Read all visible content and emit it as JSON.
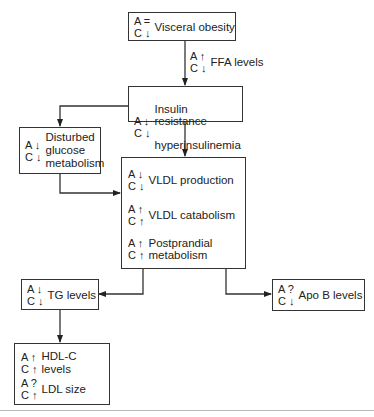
{
  "diagram": {
    "nodes": {
      "visceral": {
        "a": "A =",
        "c": "C ↓",
        "label": "Visceral obesity"
      },
      "ffa": {
        "a": "A ↑",
        "c": "C ↓",
        "label": "FFA levels"
      },
      "insulin": {
        "a": "A ↓",
        "c": "C ↓",
        "line1": "Insulin resistance",
        "line2": "hyperinsulinemia"
      },
      "glucose": {
        "a": "A ↓",
        "c": "C ↓",
        "label": "Disturbed\nglucose\nmetabolism"
      },
      "vldl_production": {
        "a": "A ↓",
        "c": "C ↓",
        "label": "VLDL production"
      },
      "vldl_catabolism": {
        "a": "A ↑",
        "c": "C ↑",
        "label": "VLDL catabolism"
      },
      "postprandial": {
        "a": "A ↑",
        "c": "C ↑",
        "label": "Postprandial\nmetabolism"
      },
      "tg": {
        "a": "A ↓",
        "c": "C ↓",
        "label": "TG levels"
      },
      "apob": {
        "a": "A ?",
        "c": "C ↓",
        "label": "Apo B levels"
      },
      "hdl": {
        "a": "A ↑",
        "c": "C ↑",
        "label": "HDL-C levels"
      },
      "ldl": {
        "a": "A ?",
        "c": "C ↑",
        "label": "LDL size"
      }
    },
    "edges": [
      [
        "visceral",
        "insulin"
      ],
      [
        "insulin",
        "glucose"
      ],
      [
        "insulin",
        "vldl"
      ],
      [
        "glucose",
        "vldl"
      ],
      [
        "vldl",
        "tg"
      ],
      [
        "vldl",
        "apob"
      ],
      [
        "tg",
        "hdl"
      ]
    ],
    "colors": {
      "line": "#333333",
      "separator": "#bbbbbb"
    }
  }
}
